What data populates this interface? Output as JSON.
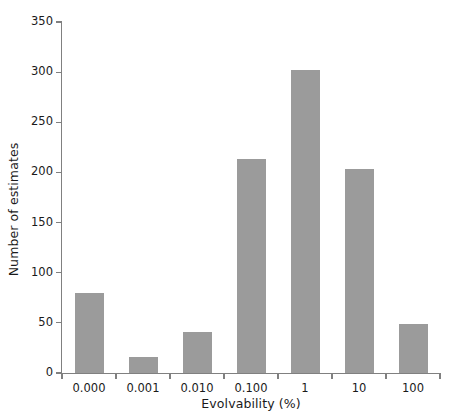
{
  "chart_data": {
    "type": "bar",
    "title": "",
    "xlabel": "Evolvability (%)",
    "ylabel": "Number of estimates",
    "categories": [
      "0.000",
      "0.001",
      "0.010",
      "0.100",
      "1",
      "10",
      "100"
    ],
    "values": [
      80,
      16,
      41,
      213,
      302,
      203,
      49
    ],
    "ylim": [
      0,
      350
    ],
    "yticks": [
      0,
      50,
      100,
      150,
      200,
      250,
      300,
      350
    ],
    "ytick_labels": [
      "0",
      "50",
      "100",
      "150",
      "200",
      "250",
      "300",
      "350"
    ],
    "grid": false,
    "legend": null,
    "bar_color": "#9b9b9b",
    "axis_color": "#808080",
    "text_color": "#1a1a1a"
  }
}
